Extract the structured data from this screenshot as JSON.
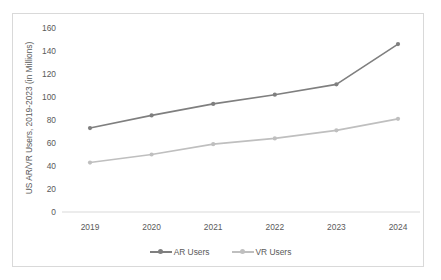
{
  "chart_data": {
    "type": "line",
    "title": "",
    "xlabel": "",
    "ylabel": "US AR/VR Users, 2019-2023 (in Millions)",
    "categories": [
      "2019",
      "2020",
      "2021",
      "2022",
      "2023",
      "2024"
    ],
    "x_tick_labels": [
      "2019",
      "2020",
      "2021",
      "2022",
      "2023",
      "2024"
    ],
    "y_tick_labels": [
      "160",
      "140",
      "120",
      "100",
      "80",
      "60",
      "40",
      "20",
      "0"
    ],
    "y_ticks": [
      160,
      140,
      120,
      100,
      80,
      60,
      40,
      20,
      0
    ],
    "ylim": [
      0,
      160
    ],
    "grid": false,
    "legend_position": "bottom",
    "series": [
      {
        "name": "AR Users",
        "values": [
          73,
          84,
          94,
          102,
          111,
          146
        ],
        "color": "#7f7f7f",
        "marker": "circle"
      },
      {
        "name": "VR Users",
        "values": [
          43,
          50,
          59,
          64,
          71,
          81
        ],
        "color": "#bfbfbf",
        "marker": "circle"
      }
    ],
    "legend_entries": [
      "AR Users",
      "VR Users"
    ],
    "colors": {
      "ar_users": "#7f7f7f",
      "vr_users": "#bfbfbf",
      "axis_line": "#d9d9d9",
      "border": "#d9d9d9",
      "tick_text": "#5a5a5a",
      "background": "#ffffff"
    }
  }
}
